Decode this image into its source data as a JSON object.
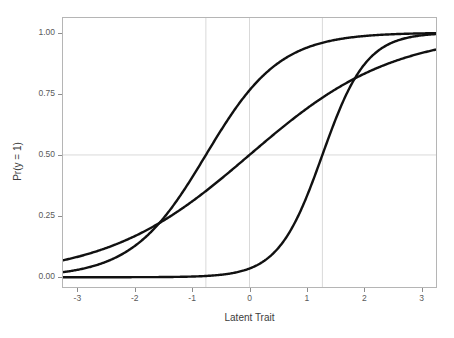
{
  "chart_data": {
    "type": "line",
    "title": "",
    "subtitle": "",
    "xlabel": "Latent Trait",
    "ylabel": "Pr(y = 1)",
    "xlim": [
      -3.25,
      3.25
    ],
    "ylim": [
      -0.04,
      1.06
    ],
    "xticks": [
      -3,
      -2,
      -1,
      0,
      1,
      2,
      3
    ],
    "xticklabels": [
      "-3",
      "-2",
      "-1",
      "0",
      "1",
      "2",
      "3"
    ],
    "yticks": [
      0.0,
      0.25,
      0.5,
      0.75,
      1.0
    ],
    "yticklabels": [
      "0.00",
      "0.25",
      "0.50",
      "0.75",
      "1.00"
    ],
    "grid": {
      "horizontal_lines": [
        0.5
      ],
      "vertical_lines": [
        -0.76,
        0.0,
        1.27
      ],
      "color": "#d9d9d9"
    },
    "legend": null,
    "line_color": "#111111",
    "line_width": 2.4,
    "model": "2PL item characteristic curves",
    "series": [
      {
        "name": "curve-1",
        "discrimination": 1.55,
        "difficulty": -0.76,
        "x": [
          -3,
          -2.75,
          -2.5,
          -2.25,
          -2,
          -1.75,
          -1.5,
          -1.25,
          -1,
          -0.76,
          -0.5,
          -0.25,
          0,
          0.25,
          0.5,
          0.75,
          1,
          1.25,
          1.5,
          1.75,
          2,
          2.25,
          2.5,
          2.75,
          3
        ],
        "y": [
          0.035,
          0.051,
          0.074,
          0.106,
          0.149,
          0.206,
          0.278,
          0.362,
          0.455,
          0.5,
          0.641,
          0.725,
          0.797,
          0.855,
          0.899,
          0.93,
          0.952,
          0.968,
          0.978,
          0.985,
          0.99,
          0.993,
          0.996,
          0.997,
          0.998
        ]
      },
      {
        "name": "curve-2",
        "discrimination": 0.8,
        "difficulty": 0.0,
        "x": [
          -3,
          -2.75,
          -2.5,
          -2.25,
          -2,
          -1.75,
          -1.5,
          -1.25,
          -1,
          -0.75,
          -0.5,
          -0.25,
          0,
          0.25,
          0.5,
          0.75,
          1,
          1.25,
          1.5,
          1.75,
          2,
          2.25,
          2.5,
          2.75,
          3
        ],
        "y": [
          0.083,
          0.1,
          0.119,
          0.142,
          0.168,
          0.198,
          0.231,
          0.269,
          0.31,
          0.354,
          0.401,
          0.45,
          0.5,
          0.55,
          0.599,
          0.646,
          0.69,
          0.731,
          0.769,
          0.802,
          0.832,
          0.858,
          0.881,
          0.9,
          0.917
        ]
      },
      {
        "name": "curve-3",
        "discrimination": 2.6,
        "difficulty": 1.27,
        "x": [
          -3,
          -2.75,
          -2.5,
          -2.25,
          -2,
          -1.75,
          -1.5,
          -1.25,
          -1,
          -0.75,
          -0.5,
          -0.25,
          0,
          0.25,
          0.5,
          0.75,
          1,
          1.27,
          1.5,
          1.75,
          2,
          2.25,
          2.5,
          2.75,
          3
        ],
        "y": [
          0.0,
          0.001,
          0.001,
          0.002,
          0.004,
          0.008,
          0.015,
          0.029,
          0.055,
          0.1,
          0.175,
          0.285,
          0.424,
          0.572,
          0.705,
          0.81,
          0.884,
          0.5,
          0.962,
          0.978,
          0.988,
          0.993,
          0.996,
          0.998,
          0.999
        ]
      }
    ]
  }
}
